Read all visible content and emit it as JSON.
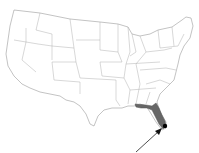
{
  "map": {
    "region": "Contiguous United States",
    "highlighted_state": "Florida",
    "highlight_color": "#666666",
    "outline_color": "#9a9a9a",
    "marker": {
      "name": "location-dot",
      "color": "#000000"
    },
    "arrow": {
      "color": "#222222",
      "points_to": "location-dot"
    }
  }
}
